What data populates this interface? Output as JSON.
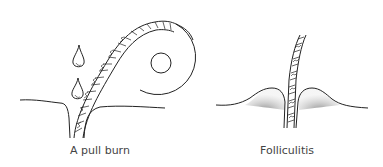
{
  "figure": {
    "panels": [
      {
        "id": "pull-burn",
        "caption": "A pull burn"
      },
      {
        "id": "folliculitis",
        "caption": "Folliculitis"
      }
    ],
    "colors": {
      "ink": "#222222",
      "shade": "#9a9a9a",
      "caption": "#444444"
    }
  }
}
